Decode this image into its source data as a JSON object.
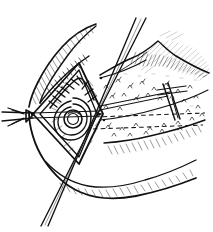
{
  "figure": {
    "domain": "line-art-illustration",
    "title": "Surgical line drawing: diamond-shaped sutured opening with retracted tissue flap",
    "style": "pen-and-ink hatched engraving",
    "width": 213,
    "height": 232,
    "background_color": "#ffffff",
    "ink_color": "#111111",
    "faint_ink_color": "#9a9a9a",
    "has_text_labels": false,
    "caption": "",
    "parts": [
      {
        "id": "tissue-flap-upper-left",
        "label": "Retracted tissue flap, upper left, dense parallel hatching along its lower border"
      },
      {
        "id": "tissue-flap-lower",
        "label": "Lower tissue margin, broad curved outline with hatching beneath"
      },
      {
        "id": "diamond-opening",
        "label": "Diamond / rhombus shaped opening at center-left with double outline"
      },
      {
        "id": "suture-line-zigzag",
        "label": "Zig-zag interrupted suture line along the upper inner border of the diamond"
      },
      {
        "id": "concentric-rings",
        "label": "Concentric ring structure (teardrop and circle) inside the diamond"
      },
      {
        "id": "probe-left",
        "label": "Pointed probe / instrument tip entering horizontally from the left edge"
      },
      {
        "id": "suture-strands-diagonal",
        "label": "Two parallel suture strands crossing the field from upper right to lower left"
      },
      {
        "id": "stippled-field",
        "label": "Stippled and hatched tissue field occupying the right half"
      },
      {
        "id": "dashed-guide-upper",
        "label": "Upper horizontal dashed reference line across the stippled field"
      },
      {
        "id": "dashed-guide-lower",
        "label": "Lower horizontal dashed reference line across the stippled field"
      },
      {
        "id": "cross-instrument",
        "label": "Cross-shaped instrument / retractor bar at the right of the field"
      },
      {
        "id": "hatch-top-right",
        "label": "Faint light hatching in the upper right background"
      }
    ]
  }
}
